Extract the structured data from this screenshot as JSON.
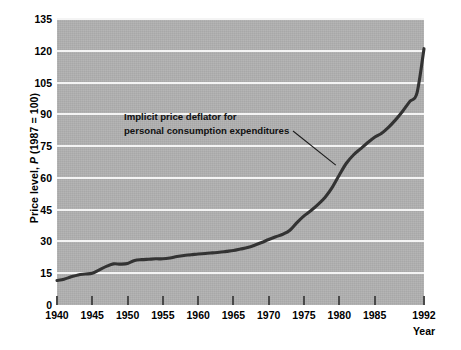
{
  "figure": {
    "background_color": "#ffffff",
    "plot_background_color": "#b0b0b0",
    "gridline_color": "#f4f4f4",
    "line_color": "#333333"
  },
  "axes": {
    "y_title_prefix": "Price level, ",
    "y_title_symbol": "P",
    "y_title_suffix": " (1987 = 100)",
    "y_title_full": "Price level, P (1987 = 100)",
    "x_title": "Year"
  },
  "annotation": {
    "line1": "Implicit price deflator for",
    "line2": "personal consumption expenditures"
  },
  "chart_data": {
    "type": "line",
    "title": "",
    "xlabel": "Year",
    "ylabel": "Price level, P (1987 = 100)",
    "xlim": [
      1940,
      1992
    ],
    "ylim": [
      0,
      135
    ],
    "xticks": [
      1940,
      1945,
      1950,
      1955,
      1960,
      1965,
      1970,
      1975,
      1980,
      1985,
      1992
    ],
    "yticks": [
      0,
      15,
      30,
      45,
      60,
      75,
      90,
      105,
      120,
      135
    ],
    "grid": "horizontal",
    "legend": "none",
    "annotations": [
      {
        "text": "Implicit price deflator for personal consumption expenditures",
        "points_to_x": 1979.5,
        "points_to_y": 66
      }
    ],
    "series": [
      {
        "name": "Implicit price deflator for personal consumption expenditures",
        "x": [
          1940,
          1941,
          1942,
          1943,
          1944,
          1945,
          1946,
          1947,
          1948,
          1949,
          1950,
          1951,
          1952,
          1953,
          1954,
          1955,
          1956,
          1957,
          1958,
          1959,
          1960,
          1961,
          1962,
          1963,
          1964,
          1965,
          1966,
          1967,
          1968,
          1969,
          1970,
          1971,
          1972,
          1973,
          1974,
          1975,
          1976,
          1977,
          1978,
          1979,
          1980,
          1981,
          1982,
          1983,
          1984,
          1985,
          1986,
          1987,
          1988,
          1989,
          1990,
          1991,
          1992
        ],
        "y": [
          11.6,
          12.2,
          13.3,
          14.2,
          14.6,
          15.0,
          16.6,
          18.2,
          19.4,
          19.3,
          19.6,
          21.0,
          21.4,
          21.6,
          21.8,
          21.8,
          22.2,
          22.9,
          23.4,
          23.7,
          24.1,
          24.3,
          24.6,
          24.9,
          25.3,
          25.7,
          26.4,
          27.1,
          28.2,
          29.5,
          30.9,
          32.2,
          33.4,
          35.3,
          38.9,
          42.1,
          44.6,
          47.5,
          50.9,
          55.5,
          61.4,
          66.9,
          70.8,
          73.7,
          76.6,
          79.2,
          81.1,
          84.0,
          87.5,
          91.6,
          96.1,
          100.0,
          121.0
        ],
        "y_at_1987_index": 51
      }
    ]
  }
}
